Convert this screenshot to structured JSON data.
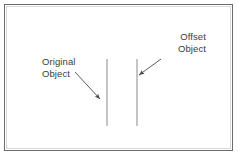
{
  "diagram": {
    "background_color": "#ffffff",
    "frame": {
      "name": "drawing-frame",
      "border_color": "#6b6b6b",
      "inner_border_color": "#d8d8d8"
    },
    "stroke_color": "#8a8a8a",
    "leader_color": "#4a4a4a",
    "text_color": "#3a3a3a",
    "annotations": [
      {
        "id": "original",
        "line1": "Original",
        "line2": "Object",
        "align": "left"
      },
      {
        "id": "offset",
        "line1": "Offset",
        "line2": "Object",
        "align": "right"
      }
    ],
    "objects": [
      {
        "id": "original-object",
        "label": "Original Object",
        "x": 107,
        "y1": 59,
        "y2": 126
      },
      {
        "id": "offset-object",
        "label": "Offset Object",
        "x": 137,
        "y1": 59,
        "y2": 126
      }
    ],
    "leaders": [
      {
        "id": "original-leader",
        "x1": 75,
        "y1": 72,
        "x2": 101,
        "y2": 100
      },
      {
        "id": "offset-leader",
        "x1": 161,
        "y1": 59,
        "x2": 138,
        "y2": 76
      }
    ]
  }
}
